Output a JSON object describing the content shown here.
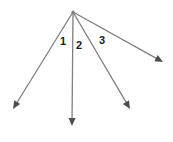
{
  "diagram": {
    "background": "#ffffff",
    "line_color": "#7f7f7f",
    "arrow_color": "#4d4d4d",
    "label_color": "#1c1c1c",
    "vertex": {
      "x": 73,
      "y": 12
    },
    "rays": [
      {
        "name": "ray-down-left",
        "x2": 13,
        "y2": 109
      },
      {
        "name": "ray-down",
        "x2": 72,
        "y2": 126
      },
      {
        "name": "ray-down-right",
        "x2": 130,
        "y2": 109
      },
      {
        "name": "ray-right",
        "x2": 163,
        "y2": 62
      }
    ],
    "labels": [
      {
        "text": "1",
        "x": 63,
        "y": 41
      },
      {
        "text": "2",
        "x": 79,
        "y": 45
      },
      {
        "text": "3",
        "x": 102,
        "y": 40
      }
    ]
  }
}
